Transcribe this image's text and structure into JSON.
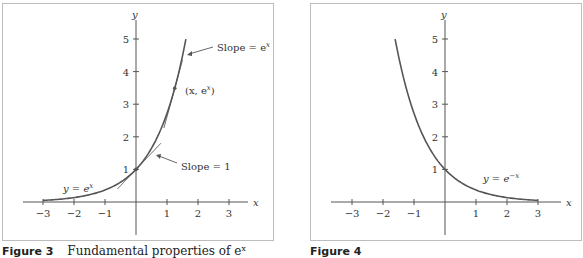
{
  "chart_data": [
    {
      "type": "line",
      "title": "",
      "caption": {
        "figure": "Figure 3",
        "text": "Fundamental properties of e^x"
      },
      "xlabel": "x",
      "ylabel": "y",
      "xlim": [
        -3.4,
        3.6
      ],
      "ylim": [
        -1,
        5.5
      ],
      "xticks": [
        -3,
        -2,
        -1,
        1,
        2,
        3
      ],
      "yticks": [
        1,
        2,
        3,
        4,
        5
      ],
      "grid": false,
      "series": [
        {
          "name": "y = e^x",
          "function": "exp(x)",
          "x_range": [
            -3,
            1.609
          ]
        },
        {
          "name": "tangent at (0,1)",
          "function": "1 + x",
          "x_range": [
            -0.6,
            0.8
          ],
          "slope": 1
        },
        {
          "name": "tangent at (x, e^x)",
          "function": "e^1.25*(1 + x - 1.25)",
          "x_range": [
            0.9,
            1.5
          ]
        }
      ],
      "annotations": [
        {
          "text": "Slope = e^x",
          "points_to": "upper tangent"
        },
        {
          "text": "(x, e^x)",
          "points_to": "point on curve"
        },
        {
          "text": "Slope = 1",
          "points_to": "tangent at (0,1)"
        },
        {
          "text": "y = e^x",
          "points_to": "curve"
        }
      ]
    },
    {
      "type": "line",
      "title": "",
      "caption": {
        "figure": "Figure 4",
        "text": ""
      },
      "xlabel": "x",
      "ylabel": "y",
      "xlim": [
        -3.4,
        3.6
      ],
      "ylim": [
        -1,
        5.5
      ],
      "xticks": [
        -3,
        -2,
        -1,
        1,
        2,
        3
      ],
      "yticks": [
        1,
        2,
        3,
        4,
        5
      ],
      "grid": false,
      "series": [
        {
          "name": "y = e^-x",
          "function": "exp(-x)",
          "x_range": [
            -1.609,
            3
          ]
        }
      ],
      "annotations": [
        {
          "text": "y = e^-x",
          "points_to": "curve"
        }
      ]
    }
  ],
  "fig3": {
    "axis_x": "x",
    "axis_y": "y",
    "xticks": [
      "−3",
      "−2",
      "−1",
      "1",
      "2",
      "3"
    ],
    "yticks": [
      "1",
      "2",
      "3",
      "4",
      "5"
    ],
    "label_slope_ex": "Slope = e",
    "label_slope_ex_sup": "x",
    "label_point": "(x, e",
    "label_point_sup": "x",
    "label_point_end": ")",
    "label_slope_1": "Slope = 1",
    "label_curve": "y = e",
    "label_curve_sup": "x",
    "caption_fig": "Figure 3",
    "caption_text": "Fundamental properties of eˣ"
  },
  "fig4": {
    "axis_x": "x",
    "axis_y": "y",
    "xticks": [
      "−3",
      "−2",
      "−1",
      "1",
      "2",
      "3"
    ],
    "yticks": [
      "1",
      "2",
      "3",
      "4",
      "5"
    ],
    "label_curve": "y = e",
    "label_curve_sup": "−x",
    "caption_fig": "Figure 4"
  },
  "colors": {
    "curve": "#555555",
    "axis": "#555555",
    "border": "#bdbdbd"
  }
}
